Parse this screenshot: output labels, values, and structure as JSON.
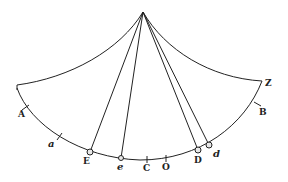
{
  "figure": {
    "type": "geometric-diagram",
    "stroke_color": "#222222",
    "background": "#ffffff",
    "labels": {
      "A": "A",
      "a": "a",
      "E": "E",
      "e": "e",
      "C": "C",
      "O": "O",
      "D": "D",
      "d": "d",
      "B": "B",
      "Z": "Z"
    }
  }
}
